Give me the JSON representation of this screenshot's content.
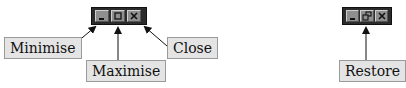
{
  "diagram": {
    "left_window_controls": {
      "buttons": [
        {
          "name": "minimise",
          "icon": "minimise-icon"
        },
        {
          "name": "maximise",
          "icon": "maximise-icon"
        },
        {
          "name": "close",
          "icon": "close-icon"
        }
      ]
    },
    "right_window_controls": {
      "buttons": [
        {
          "name": "minimise",
          "icon": "minimise-icon"
        },
        {
          "name": "restore",
          "icon": "restore-icon"
        },
        {
          "name": "close",
          "icon": "close-icon"
        }
      ]
    },
    "labels": {
      "minimise": "Minimise",
      "maximise": "Maximise",
      "close": "Close",
      "restore": "Restore"
    },
    "colors": {
      "bar": "#2b2b2b",
      "button": "#8f8f8f",
      "label_bg": "#e4e4e4",
      "arrow": "#111111"
    }
  }
}
